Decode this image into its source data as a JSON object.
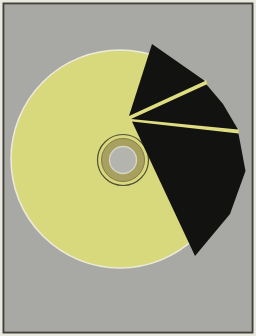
{
  "scene": {
    "description": "Flat illustration of a pale yellow compact disc on a gray framed mat; three black angular wedges fan out from the disc hub toward the upper right, separated by thin yellow gap lines, extending past the disc rim",
    "canvas": {
      "width": 256,
      "height": 336
    },
    "colors": {
      "frame_light": "#eae9e1",
      "frame_dark": "#41413a",
      "mat_gray": "#a8a9a4",
      "disc_yellow": "#d8d87d",
      "disc_rim": "#ecebdc",
      "hub_ring_dark": "#504f37",
      "hub_khaki": "#a7a05e",
      "hub_edge": "#817b49",
      "center_gray": "#b4b4af",
      "center_ring": "#d6d6c8",
      "wedge_black": "#121210",
      "gap_yellow": "#dedd82"
    },
    "disc": {
      "cx": 120,
      "cy": 159,
      "r": 109
    },
    "hub": {
      "cx": 123,
      "cy": 160,
      "outer_ring_r": 25.5,
      "clamp_r": 21.5,
      "center_r": 13.5
    },
    "gap_lines": [
      {
        "name": "gap-line-upper",
        "points": "129,114.5 206,79.5 207.5,85.5 130,120"
      },
      {
        "name": "gap-line-lower",
        "points": "130,117.5 238.5,129 239,134.5 131,121.5"
      }
    ],
    "wedges": [
      {
        "name": "wedge-top",
        "points": "129,116 152,44 205,81"
      },
      {
        "name": "wedge-middle",
        "points": "131,119 206.5,84.5 223,104 238,129.5"
      },
      {
        "name": "wedge-bottom",
        "points": "132,121.5 238.5,133.5 245.5,171 230,214 195,256"
      }
    ]
  }
}
